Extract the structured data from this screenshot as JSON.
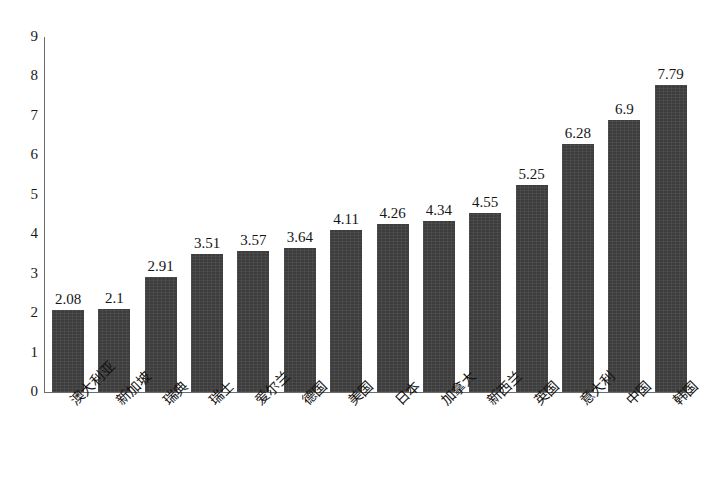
{
  "chart_data": {
    "type": "bar",
    "title": "",
    "subtitle": "",
    "xlabel": "",
    "ylabel": "",
    "categories": [
      "澳大利亚",
      "新加坡",
      "瑞典",
      "瑞士",
      "爱尔兰",
      "德国",
      "美国",
      "日本",
      "加拿大",
      "新西兰",
      "英国",
      "意大利",
      "中国",
      "韩国"
    ],
    "values": [
      2.08,
      2.1,
      2.91,
      3.51,
      3.57,
      3.64,
      4.11,
      4.26,
      4.34,
      4.55,
      5.25,
      6.28,
      6.9,
      7.79
    ],
    "data_labels": [
      "2.08",
      "2.1",
      "2.91",
      "3.51",
      "3.57",
      "3.64",
      "4.11",
      "4.26",
      "4.34",
      "4.55",
      "5.25",
      "6.28",
      "6.9",
      "7.79"
    ],
    "ylim": [
      0,
      9
    ],
    "yticks": [
      0,
      1,
      2,
      3,
      4,
      5,
      6,
      7,
      8,
      9
    ],
    "ytick_labels": [
      "0",
      "1",
      "2",
      "3",
      "4",
      "5",
      "6",
      "7",
      "8",
      "9"
    ],
    "grid": false,
    "legend": false,
    "legend_position": "none",
    "series": [
      {
        "name": "",
        "values": [
          2.08,
          2.1,
          2.91,
          3.51,
          3.57,
          3.64,
          4.11,
          4.26,
          4.34,
          4.55,
          5.25,
          6.28,
          6.9,
          7.79
        ],
        "color": "#3d3d3d"
      }
    ],
    "xtick_rotation": -45,
    "bar_color": "#3d3d3d",
    "axis_color": "#6d6d6d",
    "background_color": "#ffffff"
  }
}
